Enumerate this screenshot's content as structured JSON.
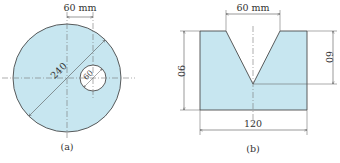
{
  "colors": {
    "fill": "#c7e6f0",
    "outline": "#4a4a4a",
    "dim": "#555555",
    "center_line": "#777777",
    "background": "#ffffff"
  },
  "figure_a": {
    "label": "(a)",
    "top_dimension": "60 mm",
    "outer_diameter": "240",
    "hole_diameter": "60"
  },
  "figure_b": {
    "label": "(b)",
    "top_dimension": "60 mm",
    "left_height": "90",
    "right_height": "60",
    "bottom_width": "120"
  }
}
